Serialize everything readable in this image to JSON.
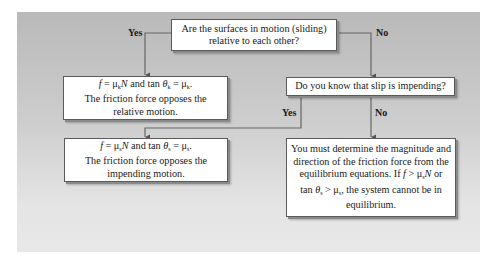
{
  "diagram": {
    "type": "flowchart",
    "topic": "Friction decision flowchart",
    "nodes": {
      "q1": {
        "lines": [
          "Are the surfaces in motion (sliding)",
          "relative to each other?"
        ]
      },
      "kinetic": {
        "eq_f": "f",
        "eq_eq1": " = μ",
        "eq_sub1": "k",
        "eq_N": "N",
        "eq_mid": " and tan ",
        "eq_theta": "θ",
        "eq_sub2": "k",
        "eq_eq2": " = μ",
        "eq_sub3": "k",
        "eq_end": ".",
        "lines": [
          "The friction force opposes the",
          "relative motion."
        ]
      },
      "q2": {
        "lines": [
          "Do you know that slip is impending?"
        ]
      },
      "static": {
        "eq_f": "f",
        "eq_eq1": " = μ",
        "eq_sub1": "s",
        "eq_N": "N",
        "eq_mid": " and tan ",
        "eq_theta": "θ",
        "eq_sub2": "s",
        "eq_eq2": " = μ",
        "eq_sub3": "s",
        "eq_end": ".",
        "lines": [
          "The friction force opposes the",
          "impending motion."
        ]
      },
      "determine": {
        "lines": [
          "You must determine the magnitude and",
          "direction of the friction force from the"
        ],
        "line3_pre": "equilibrium equations. If ",
        "line3_f": "f",
        "line3_gt": " > μ",
        "line3_sub": "s",
        "line3_N": "N",
        "line3_post": " or",
        "line4_pre": "tan ",
        "line4_theta": "θ",
        "line4_sub": "s",
        "line4_gt": " > μ",
        "line4_sub2": "s",
        "line4_post": ", the system cannot be in",
        "line5": "equilibrium."
      }
    },
    "edges": [
      {
        "from": "q1",
        "to": "kinetic",
        "label": "Yes"
      },
      {
        "from": "q1",
        "to": "q2",
        "label": "No"
      },
      {
        "from": "q2",
        "to": "static",
        "label": "Yes"
      },
      {
        "from": "q2",
        "to": "determine",
        "label": "No"
      }
    ],
    "colors": {
      "panel_top": "#b9b9b9",
      "panel_bottom": "#e8e8e8",
      "box_fill": "#ffffff",
      "box_border": "#5a5a5a",
      "connector": "#555555"
    }
  }
}
